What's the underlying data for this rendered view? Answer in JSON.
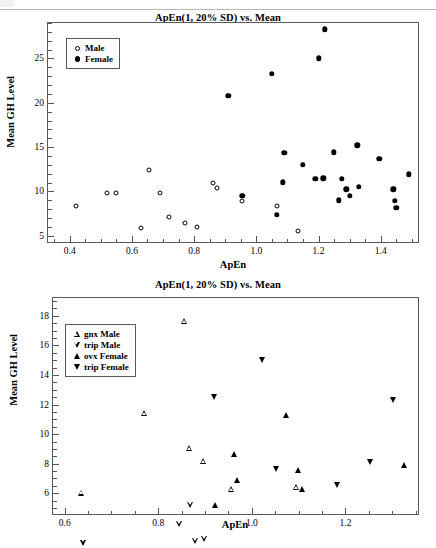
{
  "figure": {
    "background": "#ffffff",
    "marker_color": "#000000",
    "axis_color": "#5a5a5a"
  },
  "panels": [
    {
      "id": "A",
      "label": "(A)",
      "title": "ApEn(1, 20% SD) vs. Mean",
      "xlabel": "ApEn",
      "ylabel": "Mean GH Level",
      "legend": [
        {
          "label": "Male",
          "marker": "circle-open-icon"
        },
        {
          "label": "Female",
          "marker": "circle-filled-icon"
        }
      ],
      "xticks": [
        "0.4",
        "0.6",
        "0.8",
        "1.0",
        "1.2",
        "1.4"
      ],
      "yticks": [
        "5",
        "10",
        "15",
        "20",
        "25"
      ]
    },
    {
      "id": "B",
      "label": "(B)",
      "title": "ApEn(1, 20% SD) vs. Mean",
      "xlabel": "ApEn",
      "ylabel": "Mean GH Level",
      "legend": [
        {
          "label": "gnx Male",
          "marker": "triangle-up-open-icon"
        },
        {
          "label": "trip Male",
          "marker": "triangle-down-open-icon"
        },
        {
          "label": "ovx Female",
          "marker": "triangle-up-filled-icon"
        },
        {
          "label": "trip Female",
          "marker": "triangle-down-filled-icon"
        }
      ],
      "xticks": [
        "0.6",
        "0.8",
        "1.0",
        "1.2"
      ],
      "yticks": [
        "6",
        "8",
        "10",
        "12",
        "14",
        "16",
        "18"
      ]
    }
  ],
  "chart_data": [
    {
      "type": "scatter",
      "panel": "A",
      "title": "ApEn(1, 20% SD) vs. Mean",
      "xlabel": "ApEn",
      "ylabel": "Mean GH Level",
      "xlim": [
        0.33,
        1.52
      ],
      "ylim": [
        4.3,
        29.0
      ],
      "xticks": [
        0.4,
        0.6,
        0.8,
        1.0,
        1.2,
        1.4
      ],
      "yticks": [
        5,
        10,
        15,
        20,
        25
      ],
      "grid": false,
      "legend_position": "upper-left-inset",
      "series": [
        {
          "name": "Male",
          "marker": "circle-open",
          "points": [
            [
              0.42,
              8.4
            ],
            [
              0.52,
              9.85
            ],
            [
              0.55,
              9.85
            ],
            [
              0.63,
              5.85
            ],
            [
              0.655,
              12.45
            ],
            [
              0.69,
              9.8
            ],
            [
              0.72,
              7.1
            ],
            [
              0.77,
              6.4
            ],
            [
              0.81,
              6.0
            ],
            [
              0.86,
              10.95
            ],
            [
              0.875,
              10.35
            ],
            [
              0.955,
              8.9
            ],
            [
              1.065,
              8.35
            ],
            [
              1.135,
              5.55
            ]
          ]
        },
        {
          "name": "Female",
          "marker": "circle-filled",
          "points": [
            [
              0.91,
              20.8
            ],
            [
              0.955,
              9.5
            ],
            [
              1.05,
              23.3
            ],
            [
              1.065,
              7.35
            ],
            [
              1.085,
              11.05
            ],
            [
              1.09,
              14.35
            ],
            [
              1.15,
              13.0
            ],
            [
              1.19,
              11.45
            ],
            [
              1.2,
              25.0
            ],
            [
              1.215,
              11.5
            ],
            [
              1.22,
              28.3
            ],
            [
              1.25,
              14.4
            ],
            [
              1.265,
              9.0
            ],
            [
              1.275,
              11.45
            ],
            [
              1.29,
              10.25
            ],
            [
              1.3,
              9.5
            ],
            [
              1.325,
              15.2
            ],
            [
              1.33,
              10.5
            ],
            [
              1.395,
              13.65
            ],
            [
              1.44,
              10.25
            ],
            [
              1.445,
              8.95
            ],
            [
              1.45,
              8.15
            ],
            [
              1.49,
              11.95
            ]
          ]
        }
      ]
    },
    {
      "type": "scatter",
      "panel": "B",
      "title": "ApEn(1, 20% SD) vs. Mean",
      "xlabel": "ApEn",
      "ylabel": "Mean GH Level",
      "xlim": [
        0.575,
        1.355
      ],
      "ylim": [
        4.6,
        19.2
      ],
      "xticks": [
        0.6,
        0.8,
        1.0,
        1.2
      ],
      "yticks": [
        6,
        8,
        10,
        12,
        14,
        16,
        18
      ],
      "grid": false,
      "legend_position": "upper-left-inset",
      "series": [
        {
          "name": "gnx Male",
          "marker": "triangle-up-open",
          "points": [
            [
              0.635,
              6.05
            ],
            [
              0.77,
              11.85
            ],
            [
              0.855,
              18.45
            ],
            [
              0.865,
              10.25
            ],
            [
              0.895,
              9.8
            ],
            [
              0.955,
              8.3
            ],
            [
              1.095,
              8.85
            ]
          ]
        },
        {
          "name": "trip Male",
          "marker": "triangle-down-open",
          "points": [
            [
              0.64,
              5.5
            ],
            [
              0.845,
              7.15
            ],
            [
              0.868,
              8.85
            ],
            [
              0.878,
              6.8
            ],
            [
              0.898,
              7.35
            ],
            [
              0.922,
              5.9
            ],
            [
              1.098,
              6.2
            ]
          ]
        },
        {
          "name": "ovx Female",
          "marker": "triangle-up-filled",
          "points": [
            [
              0.922,
              5.2
            ],
            [
              0.962,
              8.65
            ],
            [
              0.968,
              6.9
            ],
            [
              1.072,
              11.3
            ],
            [
              1.098,
              7.55
            ],
            [
              1.108,
              6.3
            ],
            [
              1.325,
              7.9
            ]
          ]
        },
        {
          "name": "trip Female",
          "marker": "triangle-down-filled",
          "points": [
            [
              0.918,
              12.5
            ],
            [
              1.022,
              15.0
            ],
            [
              1.052,
              7.65
            ],
            [
              1.182,
              6.55
            ],
            [
              1.252,
              8.1
            ],
            [
              1.302,
              12.3
            ]
          ]
        }
      ]
    }
  ]
}
